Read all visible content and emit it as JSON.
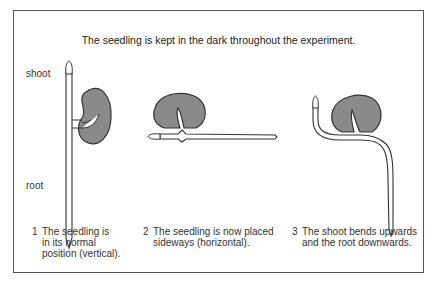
{
  "title": "The seedling is kept in the dark throughout the experiment.",
  "labels": {
    "shoot": "shoot",
    "root": "root"
  },
  "steps": [
    {
      "number": "1",
      "lines": [
        "The seedling is",
        "in its normal",
        "position (vertical)."
      ]
    },
    {
      "number": "2",
      "lines": [
        "The seedling is now placed",
        "sideways (horizontal)."
      ]
    },
    {
      "number": "3",
      "lines": [
        "The shoot bends upwards",
        "and the root downwards."
      ]
    }
  ],
  "colors": {
    "seed_fill": "#8a8a8a",
    "outline": "#333333",
    "frame": "#555555"
  }
}
